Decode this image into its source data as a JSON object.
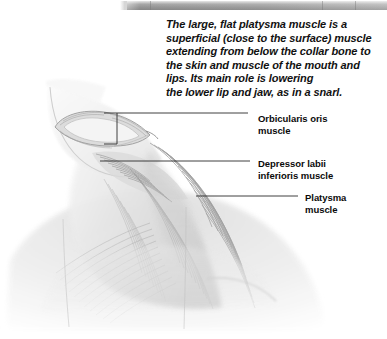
{
  "page": {
    "width": 387,
    "height": 339,
    "background_color": "#ffffff"
  },
  "top_bar": {
    "name": "window-chrome-bar",
    "color_light": "#d6d6d6",
    "color_mid": "#9d9d9d",
    "color_dark": "#8f8f8f"
  },
  "caption": {
    "lines": [
      "The large, flat platysma muscle is a",
      "superficial (close to the surface) muscle",
      "extending from below the collar bone to",
      "the skin and muscle of the mouth and",
      "lips. Its main role is lowering",
      "the lower lip and jaw, as in a snarl."
    ],
    "text_color": "#111111"
  },
  "labels": [
    {
      "id": "orbicularis-oris",
      "lines": [
        "Orbicularis oris",
        "muscle"
      ],
      "leader": {
        "points": "100,113 115,113 115,144 250,144",
        "alt_points": "100,113 248,113"
      }
    },
    {
      "id": "depressor-labii-inferioris",
      "lines": [
        "Depressor labii",
        "inferioris muscle"
      ],
      "leader": {
        "points": "100,161 250,161"
      }
    },
    {
      "id": "platysma",
      "lines": [
        "Platysma",
        "muscle"
      ],
      "leader": {
        "points": "196,196 298,196"
      }
    }
  ],
  "illustration": {
    "name": "platysma-anatomy-drawing",
    "description": "Grayscale anatomical drawing of the head in profile showing the orbicularis oris ring around the mouth and the broad fan-shaped platysma muscle sweeping from the jaw down across the neck to the collar bone and chest.",
    "style": "pencil-shaded grayscale",
    "line_color": "#3a3a3a",
    "fiber_color": "#8d8d8d",
    "skin_tone": "#f2f2f2"
  }
}
